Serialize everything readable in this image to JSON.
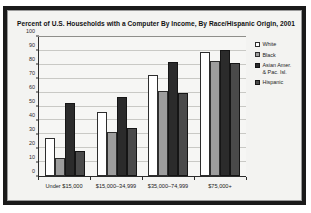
{
  "chart_data": {
    "type": "bar",
    "title": "Percent of U.S. Households with a Computer By Income, By Race/Hispanic Origin, 2001",
    "xlabel": "",
    "ylabel": "",
    "ylim": [
      0,
      100
    ],
    "yticks": [
      0,
      10,
      20,
      30,
      40,
      50,
      60,
      70,
      80,
      90,
      100
    ],
    "ytick_labels": [
      "0",
      "10",
      "20",
      "30",
      "40",
      "50",
      "60",
      "70",
      "80",
      "90",
      "100"
    ],
    "grid": true,
    "legend_position": "right",
    "categories": [
      "Under $15,000",
      "$15,000–34,999",
      "$35,000–74,999",
      "$75,000+"
    ],
    "series": [
      {
        "name": "White",
        "swatch": "s-white",
        "color": "#ffffff",
        "values": [
          27,
          46,
          73,
          89.5
        ]
      },
      {
        "name": "Black",
        "swatch": "s-black",
        "color": "#9d9d9d",
        "values": [
          13,
          31.5,
          61.5,
          83
        ]
      },
      {
        "name": "Asian Amer. & Pac. Isl.",
        "legend_line1": "Asian Amer.",
        "legend_line2": "& Pac. Isl.",
        "swatch": "s-asian",
        "color": "#2b2b2b",
        "values": [
          52.5,
          57,
          82,
          91
        ]
      },
      {
        "name": "Hispanic",
        "swatch": "s-hispanic",
        "color": "#4a4a4a",
        "values": [
          18,
          34.5,
          60,
          81
        ]
      }
    ]
  }
}
